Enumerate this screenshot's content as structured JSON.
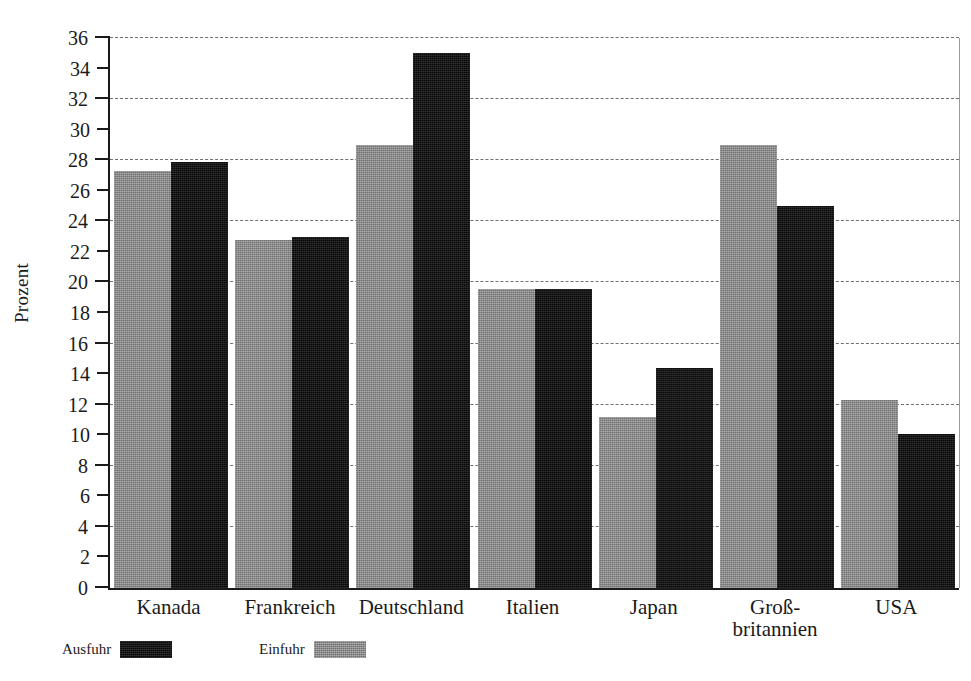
{
  "chart_data": {
    "type": "bar",
    "title": "",
    "xlabel": "",
    "ylabel": "Prozent",
    "ylim": [
      0,
      36
    ],
    "ytick_step": 2,
    "gridline_step": 4,
    "grid": true,
    "legend_position": "bottom-left",
    "categories": [
      "Kanada",
      "Frankreich",
      "Deutschland",
      "Italien",
      "Japan",
      "Groß-\nbritannien",
      "USA"
    ],
    "yticks": [
      0,
      2,
      4,
      6,
      8,
      10,
      12,
      14,
      16,
      18,
      20,
      22,
      24,
      26,
      28,
      30,
      32,
      34,
      36
    ],
    "gridline_values": [
      4,
      8,
      12,
      16,
      20,
      24,
      28,
      32,
      36
    ],
    "series": [
      {
        "name": "Einfuhr",
        "color": "#8a8a8a",
        "values": [
          27.3,
          22.8,
          29.0,
          19.6,
          11.2,
          29.0,
          12.3
        ]
      },
      {
        "name": "Ausfuhr",
        "color": "#121212",
        "values": [
          27.9,
          23.0,
          35.0,
          19.6,
          14.4,
          25.0,
          10.1
        ]
      }
    ]
  },
  "legend": {
    "entries": [
      {
        "label": "Ausfuhr",
        "swatch": "black"
      },
      {
        "label": "Einfuhr",
        "swatch": "gray"
      }
    ]
  }
}
